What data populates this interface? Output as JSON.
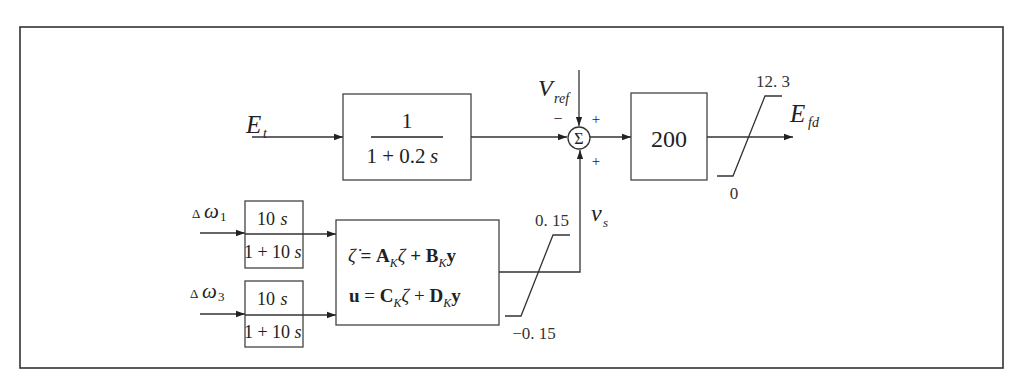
{
  "diagram": {
    "type": "block-diagram",
    "colors": {
      "line": "#333333",
      "background": "#ffffff",
      "text": "#222222"
    },
    "inputs": {
      "et": {
        "main": "E",
        "sub": "t"
      },
      "vref": {
        "main": "V",
        "sub": "ref"
      },
      "dw1": {
        "delta": "Δ",
        "main": "ω",
        "sub": "1"
      },
      "dw3": {
        "delta": "Δ",
        "main": "ω",
        "sub": "3"
      }
    },
    "blocks": {
      "filter": {
        "numerator": "1",
        "denominator_prefix": "1 + 0.2",
        "denominator_var": "s"
      },
      "gain": {
        "label": "200"
      },
      "washout1": {
        "numerator_num": "10",
        "numerator_var": "s",
        "denominator_prefix": "1 + 10",
        "denominator_var": "s"
      },
      "washout3": {
        "numerator_num": "10",
        "numerator_var": "s",
        "denominator_prefix": "1 + 10",
        "denominator_var": "s"
      },
      "controller": {
        "eq1": {
          "lhs": "ζ̇",
          "eq": " = ",
          "A": "A",
          "K1": "K",
          "z1": "ζ",
          "plus": " + ",
          "B": "B",
          "K2": "K",
          "y": "y"
        },
        "eq2": {
          "lhs": "u",
          "eq": " = ",
          "C": "C",
          "K1": "K",
          "z1": "ζ",
          "plus": " + ",
          "D": "D",
          "K2": "K",
          "y": "y"
        }
      }
    },
    "summing_junction": {
      "symbol": "Σ",
      "signs": {
        "left": "−",
        "top": "+",
        "bottom": "+"
      }
    },
    "limiters": {
      "output": {
        "upper": "12. 3",
        "lower": "0"
      },
      "pss": {
        "upper": "0. 15",
        "lower": "−0. 15"
      }
    },
    "outputs": {
      "efd": {
        "main": "E",
        "sub": "fd"
      },
      "vs": {
        "main": "v",
        "sub": "s"
      }
    }
  }
}
